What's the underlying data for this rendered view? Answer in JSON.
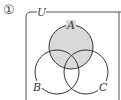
{
  "problem": {
    "number_label": "①"
  },
  "diagram": {
    "universe_label": "U",
    "sets": [
      {
        "name": "A",
        "label": "A",
        "shaded": true
      },
      {
        "name": "B",
        "label": "B",
        "shaded": false
      },
      {
        "name": "C",
        "label": "C",
        "shaded": false
      }
    ],
    "shaded_region": "A",
    "colors": {
      "shade": "#d9d9d9",
      "stroke": "#333333",
      "frame": "#555555"
    }
  }
}
